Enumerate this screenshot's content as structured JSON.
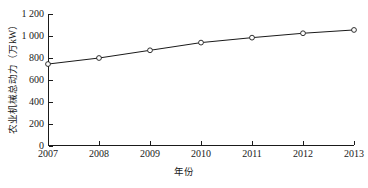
{
  "chart_data": {
    "type": "line",
    "title": "",
    "xlabel": "年份",
    "ylabel": "农业机械总动力（万kW）",
    "categories": [
      "2007",
      "2008",
      "2009",
      "2010",
      "2011",
      "2012",
      "2013"
    ],
    "x": [
      2007,
      2008,
      2009,
      2010,
      2011,
      2012,
      2013
    ],
    "values": [
      745,
      800,
      870,
      940,
      985,
      1025,
      1055
    ],
    "series": [
      {
        "name": "农业机械总动力",
        "values": [
          745,
          800,
          870,
          940,
          985,
          1025,
          1055
        ]
      }
    ],
    "ylim": [
      0,
      1200
    ],
    "xlim": [
      2007,
      2013
    ],
    "yticks": [
      0,
      200,
      400,
      600,
      800,
      1000,
      1200
    ],
    "ytick_labels": [
      "0",
      "200",
      "400",
      "600",
      "800",
      "1 000",
      "1 200"
    ],
    "xticks": [
      2007,
      2008,
      2009,
      2010,
      2011,
      2012,
      2013
    ],
    "xtick_labels": [
      "2007",
      "2008",
      "2009",
      "2010",
      "2011",
      "2012",
      "2013"
    ],
    "grid": false,
    "legend": false,
    "legend_position": "none",
    "marker": "circle-open",
    "line_color": "#1a1a1a",
    "marker_color": "#1a1a1a",
    "background_color": "#ffffff"
  }
}
